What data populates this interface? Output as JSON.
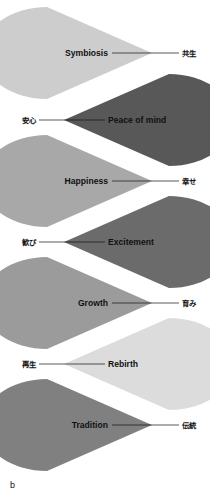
{
  "figure": {
    "caption": "b",
    "background": "#ffffff",
    "line_color": "#111111",
    "text_color": "#111111"
  },
  "chart_data": {
    "type": "diagram",
    "title": "",
    "subtitle": "",
    "xlabel": "",
    "ylabel": "",
    "legend": [],
    "shape": "cone",
    "count": 7,
    "categories": [
      "Symbiosis",
      "Peace of mind",
      "Happiness",
      "Excitement",
      "Growth",
      "Rebirth",
      "Tradition"
    ],
    "values": [
      1,
      2,
      3,
      4,
      5,
      6,
      7
    ],
    "items": [
      {
        "index": 1,
        "label_en": "Symbiosis",
        "label_jp": "共生",
        "color": "#cdcdcd",
        "direction": "right",
        "apex_x": 152,
        "apex_y": 53,
        "arc_x": 47,
        "half_height": 46,
        "en_anchor": "end",
        "en_x": 108,
        "en_y": 56,
        "jp_anchor": "start",
        "jp_x": 182,
        "jp_y": 56,
        "leader_x1": 112,
        "leader_x2": 179
      },
      {
        "index": 2,
        "label_en": "Peace of mind",
        "label_jp": "安心",
        "color": "#585858",
        "direction": "left",
        "apex_x": 64,
        "apex_y": 120,
        "arc_x": 169,
        "half_height": 46,
        "en_anchor": "start",
        "en_x": 108,
        "en_y": 123,
        "jp_anchor": "end",
        "jp_x": 36,
        "jp_y": 123,
        "leader_x1": 39,
        "leader_x2": 105
      },
      {
        "index": 3,
        "label_en": "Happiness",
        "label_jp": "幸せ",
        "color": "#a8a8a8",
        "direction": "right",
        "apex_x": 152,
        "apex_y": 181,
        "arc_x": 47,
        "half_height": 46,
        "en_anchor": "end",
        "en_x": 108,
        "en_y": 184,
        "jp_anchor": "start",
        "jp_x": 182,
        "jp_y": 184,
        "leader_x1": 112,
        "leader_x2": 179
      },
      {
        "index": 4,
        "label_en": "Excitement",
        "label_jp": "歓び",
        "color": "#6b6b6b",
        "direction": "left",
        "apex_x": 64,
        "apex_y": 242,
        "arc_x": 169,
        "half_height": 46,
        "en_anchor": "start",
        "en_x": 108,
        "en_y": 245,
        "jp_anchor": "end",
        "jp_x": 36,
        "jp_y": 245,
        "leader_x1": 39,
        "leader_x2": 105
      },
      {
        "index": 5,
        "label_en": "Growth",
        "label_jp": "育み",
        "color": "#9b9b9b",
        "direction": "right",
        "apex_x": 152,
        "apex_y": 303,
        "arc_x": 47,
        "half_height": 46,
        "en_anchor": "end",
        "en_x": 108,
        "en_y": 306,
        "jp_anchor": "start",
        "jp_x": 182,
        "jp_y": 306,
        "leader_x1": 112,
        "leader_x2": 179
      },
      {
        "index": 6,
        "label_en": "Rebirth",
        "label_jp": "再生",
        "color": "#dcdcdc",
        "direction": "left",
        "apex_x": 64,
        "apex_y": 364,
        "arc_x": 169,
        "half_height": 46,
        "en_anchor": "start",
        "en_x": 108,
        "en_y": 367,
        "jp_anchor": "end",
        "jp_x": 36,
        "jp_y": 367,
        "leader_x1": 39,
        "leader_x2": 105
      },
      {
        "index": 7,
        "label_en": "Tradition",
        "label_jp": "伝統",
        "color": "#808080",
        "direction": "right",
        "apex_x": 152,
        "apex_y": 425,
        "arc_x": 47,
        "half_height": 46,
        "en_anchor": "end",
        "en_x": 108,
        "en_y": 428,
        "jp_anchor": "start",
        "jp_x": 182,
        "jp_y": 428,
        "leader_x1": 112,
        "leader_x2": 179
      }
    ]
  }
}
